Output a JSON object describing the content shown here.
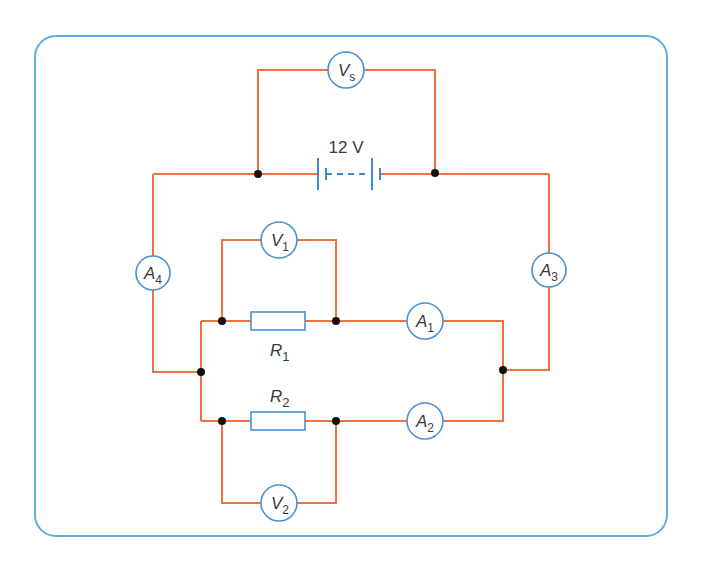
{
  "diagram": {
    "type": "electric circuit",
    "supply": {
      "label": "12 V",
      "voltage_value": 12,
      "unit": "V"
    },
    "meters": [
      {
        "id": "Vs",
        "symbol": "V",
        "subscript": "s",
        "kind": "voltmeter",
        "position": "across supply"
      },
      {
        "id": "V1",
        "symbol": "V",
        "subscript": "1",
        "kind": "voltmeter",
        "position": "across R1"
      },
      {
        "id": "V2",
        "symbol": "V",
        "subscript": "2",
        "kind": "voltmeter",
        "position": "across R2"
      },
      {
        "id": "A1",
        "symbol": "A",
        "subscript": "1",
        "kind": "ammeter",
        "position": "R1 branch"
      },
      {
        "id": "A2",
        "symbol": "A",
        "subscript": "2",
        "kind": "ammeter",
        "position": "R2 branch"
      },
      {
        "id": "A3",
        "symbol": "A",
        "subscript": "3",
        "kind": "ammeter",
        "position": "right main wire"
      },
      {
        "id": "A4",
        "symbol": "A",
        "subscript": "4",
        "kind": "ammeter",
        "position": "left main wire"
      }
    ],
    "resistors": [
      {
        "id": "R1",
        "symbol": "R",
        "subscript": "1"
      },
      {
        "id": "R2",
        "symbol": "R",
        "subscript": "2"
      }
    ],
    "colors": {
      "wire": "#ea7440",
      "component": "#4a90d0",
      "frame": "#5aaee0",
      "junction": "#111111"
    }
  }
}
